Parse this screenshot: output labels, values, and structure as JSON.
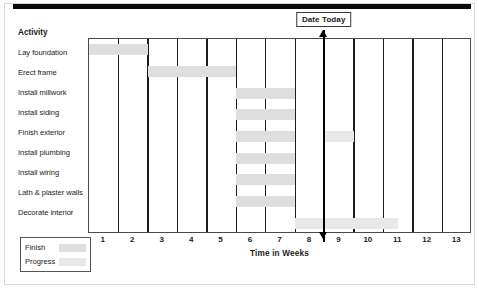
{
  "chart_data": {
    "type": "bar",
    "chart_kind": "gantt",
    "title": "",
    "xlabel": "Time  in Weeks",
    "ylabel": "Activity",
    "xlim": [
      0,
      13
    ],
    "grid": true,
    "x_tick_labels": [
      "1",
      "2",
      "3",
      "4",
      "5",
      "6",
      "7",
      "8",
      "9",
      "10",
      "11",
      "12",
      "13"
    ],
    "categories": [
      "Lay foundation",
      "Erect frame",
      "Install millwork",
      "Install siding",
      "Finish exterior",
      "Install plumbing",
      "Install wiring",
      "Lath & plaster walls",
      "Decorate interior"
    ],
    "bars": [
      {
        "activity": "Lay foundation",
        "start_week": 0,
        "end_week": 2,
        "kind": "finish"
      },
      {
        "activity": "Erect frame",
        "start_week": 2,
        "end_week": 5,
        "kind": "finish"
      },
      {
        "activity": "Install millwork",
        "start_week": 5,
        "end_week": 7,
        "kind": "finish"
      },
      {
        "activity": "Install siding",
        "start_week": 5,
        "end_week": 7,
        "kind": "finish"
      },
      {
        "activity": "Finish exterior",
        "start_week": 5,
        "end_week": 7,
        "kind": "finish"
      },
      {
        "activity": "Finish exterior",
        "start_week": 8,
        "end_week": 9,
        "kind": "progress"
      },
      {
        "activity": "Install plumbing",
        "start_week": 5,
        "end_week": 7,
        "kind": "finish"
      },
      {
        "activity": "Install wiring",
        "start_week": 5,
        "end_week": 7,
        "kind": "finish"
      },
      {
        "activity": "Lath & plaster walls",
        "start_week": 5,
        "end_week": 7,
        "kind": "finish"
      },
      {
        "activity": "Decorate interior",
        "start_week": 7,
        "end_week": 10.5,
        "kind": "progress"
      }
    ],
    "marker": {
      "label": "Date Today",
      "week": 8
    },
    "legend": {
      "position": "bottom-left",
      "entries": [
        {
          "label": "Finish",
          "color": "#dedede"
        },
        {
          "label": "Progress",
          "color": "#e8e8e8"
        }
      ]
    },
    "colors": {
      "finish": "#dedede",
      "progress": "#e8e8e8",
      "gridline": "#1d1d1d",
      "marker": "#000000",
      "text": "#1a1a1a"
    }
  }
}
